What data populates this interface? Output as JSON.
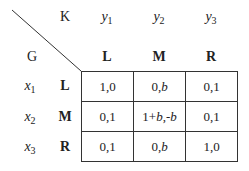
{
  "game": {
    "row_player": "G",
    "col_player": "K",
    "col_vars": [
      {
        "name": "y",
        "sub": "1"
      },
      {
        "name": "y",
        "sub": "2"
      },
      {
        "name": "y",
        "sub": "3"
      }
    ],
    "col_strategies": [
      "L",
      "M",
      "R"
    ],
    "row_vars": [
      {
        "name": "x",
        "sub": "1"
      },
      {
        "name": "x",
        "sub": "2"
      },
      {
        "name": "x",
        "sub": "3"
      }
    ],
    "row_strategies": [
      "L",
      "M",
      "R"
    ],
    "payoffs": [
      [
        "1,0",
        "0,b",
        "0,1"
      ],
      [
        "0,1",
        "1+b,-b",
        "0,1"
      ],
      [
        "0,1",
        "0,b",
        "1,0"
      ]
    ]
  }
}
